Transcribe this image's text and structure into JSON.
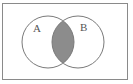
{
  "diagram": {
    "type": "venn",
    "universe": {
      "x": 2.5,
      "y": 3.5,
      "width": 125,
      "height": 76,
      "stroke": "#8a8a8a"
    },
    "sets": [
      {
        "label": "A",
        "cx": 48,
        "cy": 42,
        "r": 26,
        "label_x": 33,
        "label_y": 32
      },
      {
        "label": "B",
        "cx": 78,
        "cy": 42,
        "r": 26,
        "label_x": 80,
        "label_y": 31
      }
    ],
    "shaded_region": "A ∩ B",
    "shade_color": "#8c8c8c",
    "stroke_color": "#7a7a7a"
  }
}
